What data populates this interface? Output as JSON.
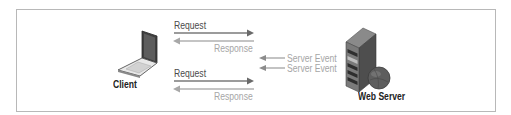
{
  "diagram": {
    "type": "client-server event flow",
    "nodes": {
      "client": {
        "label": "Client",
        "icon": "laptop-icon"
      },
      "server": {
        "label": "Web Server",
        "icon": "server-tower-icon"
      }
    },
    "flows": [
      {
        "label": "Request",
        "direction": "client-to-server",
        "color": "#7a7a7a"
      },
      {
        "label": "Response",
        "direction": "server-to-client",
        "color": "#b0b0b0"
      },
      {
        "label": "Server Event",
        "direction": "server-to-client",
        "color": "#9a9a9a"
      },
      {
        "label": "Server Event",
        "direction": "server-to-client",
        "color": "#9a9a9a"
      },
      {
        "label": "Request",
        "direction": "client-to-server",
        "color": "#7a7a7a"
      },
      {
        "label": "Response",
        "direction": "server-to-client",
        "color": "#b0b0b0"
      }
    ],
    "colors": {
      "frame_border": "#b8b8b8",
      "request_arrow": "#7a7a7a",
      "response_arrow": "#b0b0b0",
      "laptop_screen": "#4a4a4a",
      "server_body": "#6e6e6e",
      "globe": "#5a5a5a"
    }
  }
}
